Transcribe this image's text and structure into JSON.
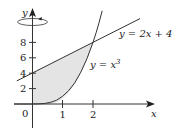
{
  "figure": {
    "axes": {
      "x_label": "x",
      "y_label": "y",
      "origin_label": "0",
      "x_ticks": [
        "1",
        "2"
      ],
      "y_ticks": [
        "2",
        "4",
        "6",
        "8"
      ]
    },
    "curves": {
      "line_label": "y = 2x + 4",
      "cubic_label_prefix": "y = x",
      "cubic_label_exp": "3"
    },
    "rotation_axis": "y-axis",
    "colors": {
      "stroke": "#333333",
      "shade": "#e4e4e4"
    }
  }
}
